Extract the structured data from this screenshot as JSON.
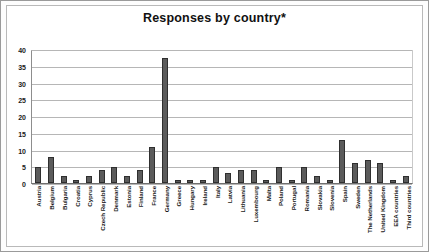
{
  "chart_data": {
    "type": "bar",
    "title": "Responses by country*",
    "xlabel": "",
    "ylabel": "",
    "ylim": [
      0,
      40
    ],
    "yticks": [
      40,
      35,
      30,
      25,
      20,
      15,
      10,
      5,
      0
    ],
    "grid": true,
    "legend": "none",
    "bar_color": "#5b5b5b",
    "categories": [
      "Austria",
      "Belgium",
      "Bulgaria",
      "Croatia",
      "Cyprus",
      "Czech Republic",
      "Denmark",
      "Estonia",
      "Finland",
      "France",
      "Germany",
      "Greece",
      "Hungary",
      "Ireland",
      "Italy",
      "Latvia",
      "Lithuania",
      "Luxembourg",
      "Malta",
      "Poland",
      "Portugal",
      "Romania",
      "Slovakia",
      "Slovenia",
      "Spain",
      "Sweden",
      "The Netherlands",
      "United Kingdom",
      "EEA countries",
      "Third countries"
    ],
    "values": [
      5,
      8,
      2,
      1,
      2,
      4,
      5,
      2,
      4,
      11,
      38,
      1,
      1,
      1,
      5,
      3,
      4,
      4,
      1,
      5,
      1,
      5,
      2,
      1,
      13,
      6,
      7,
      6,
      1,
      2
    ]
  }
}
